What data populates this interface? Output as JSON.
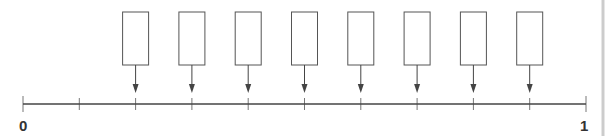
{
  "diagram": {
    "type": "number-line",
    "axis": {
      "start_label": "0",
      "end_label": "1",
      "min": 0,
      "max": 1,
      "tick_count": 11,
      "ticks": [
        0,
        0.1,
        0.2,
        0.3,
        0.4,
        0.5,
        0.6,
        0.7,
        0.8,
        0.9,
        1
      ]
    },
    "boxes": [
      {
        "position": 0.2,
        "text": ""
      },
      {
        "position": 0.3,
        "text": ""
      },
      {
        "position": 0.4,
        "text": ""
      },
      {
        "position": 0.5,
        "text": ""
      },
      {
        "position": 0.6,
        "text": ""
      },
      {
        "position": 0.7,
        "text": ""
      },
      {
        "position": 0.8,
        "text": ""
      },
      {
        "position": 0.9,
        "text": ""
      }
    ],
    "colors": {
      "line": "#444444",
      "box_border": "#555555",
      "tick": "#777777",
      "right_border": "#cccccc"
    }
  }
}
